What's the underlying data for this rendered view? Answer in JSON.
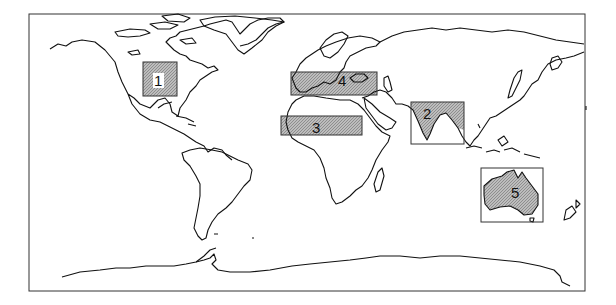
{
  "map": {
    "type": "world-outline",
    "frame": {
      "x": 29,
      "y": 14,
      "width": 556,
      "height": 277
    },
    "colors": {
      "outline": "#111111",
      "shading": "#a8a8a8",
      "background": "#ffffff"
    }
  },
  "regions": [
    {
      "id": "1",
      "label": "1",
      "area": "Central North America",
      "box": {
        "x": 143,
        "y": 62,
        "w": 34,
        "h": 34
      },
      "label_pos": {
        "x": 155,
        "y": 86
      }
    },
    {
      "id": "2",
      "label": "2",
      "area": "South Asia / India",
      "box": {
        "x": 411,
        "y": 102,
        "w": 53,
        "h": 42
      },
      "label_pos": {
        "x": 423,
        "y": 119
      }
    },
    {
      "id": "3",
      "label": "3",
      "area": "Sahel / North Africa",
      "box": {
        "x": 281,
        "y": 116,
        "w": 81,
        "h": 19
      },
      "label_pos": {
        "x": 313,
        "y": 133
      }
    },
    {
      "id": "4",
      "label": "4",
      "area": "Mediterranean",
      "box": {
        "x": 291,
        "y": 72,
        "w": 86,
        "h": 23
      },
      "label_pos": {
        "x": 339,
        "y": 85
      }
    },
    {
      "id": "5",
      "label": "5",
      "area": "Australia",
      "box": {
        "x": 481,
        "y": 168,
        "w": 62,
        "h": 54
      },
      "label_pos": {
        "x": 511,
        "y": 197
      }
    }
  ]
}
